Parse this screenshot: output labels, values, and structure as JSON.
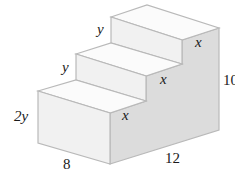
{
  "figure": {
    "type": "staircase-solid",
    "colors": {
      "front_face": "#f1f1f1",
      "top_face": "#fbfbfb",
      "side_face": "#dcdcdc",
      "edge": "#b9b9b9",
      "text": "#1a1a1a"
    },
    "labels": {
      "top_step_height": "y",
      "middle_step_height": "y",
      "bottom_step_height": "2y",
      "top_step_depth": "x",
      "middle_step_depth": "x",
      "bottom_step_depth": "x",
      "total_height": "10",
      "width": "8",
      "length": "12"
    }
  }
}
